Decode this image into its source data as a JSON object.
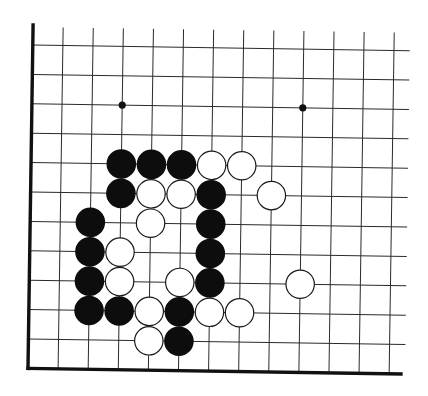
{
  "diagram": {
    "type": "go-board-fragment",
    "columns": 13,
    "rows": 12,
    "edges": [
      "left",
      "bottom"
    ],
    "origin": {
      "x": 28,
      "y": 45
    },
    "spacing": {
      "x": 30.1,
      "y": 29.4
    },
    "line_top_extend_to": 27,
    "line_right_extend_to": 405,
    "star_points": [
      {
        "col": 3,
        "row": 2
      },
      {
        "col": 9,
        "row": 2
      }
    ],
    "stones": [
      {
        "color": "black",
        "col": 3,
        "row": 4
      },
      {
        "color": "black",
        "col": 4,
        "row": 4
      },
      {
        "color": "black",
        "col": 5,
        "row": 4
      },
      {
        "color": "white",
        "col": 6,
        "row": 4
      },
      {
        "color": "white",
        "col": 7,
        "row": 4
      },
      {
        "color": "black",
        "col": 3,
        "row": 5
      },
      {
        "color": "white",
        "col": 4,
        "row": 5
      },
      {
        "color": "white",
        "col": 5,
        "row": 5
      },
      {
        "color": "black",
        "col": 6,
        "row": 5
      },
      {
        "color": "white",
        "col": 8,
        "row": 5
      },
      {
        "color": "black",
        "col": 2,
        "row": 6
      },
      {
        "color": "white",
        "col": 4,
        "row": 6
      },
      {
        "color": "black",
        "col": 6,
        "row": 6
      },
      {
        "color": "black",
        "col": 2,
        "row": 7
      },
      {
        "color": "white",
        "col": 3,
        "row": 7
      },
      {
        "color": "black",
        "col": 6,
        "row": 7
      },
      {
        "color": "black",
        "col": 2,
        "row": 8
      },
      {
        "color": "white",
        "col": 3,
        "row": 8
      },
      {
        "color": "white",
        "col": 5,
        "row": 8
      },
      {
        "color": "black",
        "col": 6,
        "row": 8
      },
      {
        "color": "white",
        "col": 9,
        "row": 8
      },
      {
        "color": "black",
        "col": 2,
        "row": 9
      },
      {
        "color": "black",
        "col": 3,
        "row": 9
      },
      {
        "color": "white",
        "col": 4,
        "row": 9
      },
      {
        "color": "black",
        "col": 5,
        "row": 9
      },
      {
        "color": "white",
        "col": 6,
        "row": 9
      },
      {
        "color": "white",
        "col": 7,
        "row": 9
      },
      {
        "color": "white",
        "col": 4,
        "row": 10
      },
      {
        "color": "black",
        "col": 5,
        "row": 10
      }
    ],
    "colors": {
      "background": "#ffffff",
      "line": "#2a2a2a",
      "edge": "#111111",
      "black_stone": "#0d0d0d",
      "white_stone": "#ffffff"
    }
  }
}
